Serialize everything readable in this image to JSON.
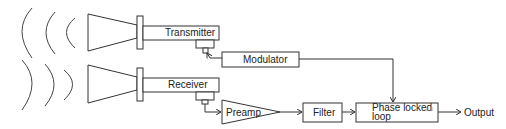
{
  "diagram": {
    "title": "",
    "blocks": {
      "transmitter": "Transmitter",
      "modulator": "Modulator",
      "receiver": "Receiver",
      "preamp": "Preamp",
      "filter": "Filter",
      "pll_line1": "Phase locked",
      "pll_line2": "loop",
      "output": "Output"
    },
    "annotation": "c d"
  }
}
